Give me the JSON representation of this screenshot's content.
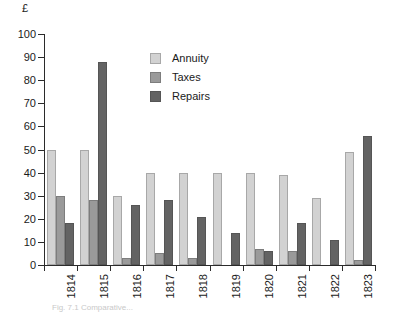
{
  "chart_data": {
    "type": "bar",
    "title": "",
    "subtitle": "",
    "xlabel": "",
    "ylabel": "£",
    "unit_label": "£",
    "categories": [
      "1814",
      "1815",
      "1816",
      "1817",
      "1818",
      "1819",
      "1820",
      "1821",
      "1822",
      "1823"
    ],
    "series": [
      {
        "name": "Annuity",
        "color": "#d2d2d2",
        "values": [
          50,
          50,
          30,
          40,
          40,
          40,
          40,
          39,
          29,
          49
        ]
      },
      {
        "name": "Taxes",
        "color": "#9a9a9a",
        "values": [
          30,
          28,
          3,
          5,
          3,
          0,
          7,
          6,
          0,
          2
        ]
      },
      {
        "name": "Repairs",
        "color": "#636363",
        "values": [
          18,
          88,
          26,
          28,
          21,
          14,
          6,
          18,
          11,
          56
        ]
      }
    ],
    "ylim": [
      0,
      100
    ],
    "ytick_step": 10,
    "yticks": [
      0,
      10,
      20,
      30,
      40,
      50,
      60,
      70,
      80,
      90,
      100
    ],
    "ytick_labels": [
      "0",
      "10",
      "20",
      "30",
      "40",
      "50",
      "60",
      "70",
      "80",
      "90",
      "100"
    ],
    "grid": false,
    "legend_position": "upper-center-right",
    "xtick_label_rotation": -90
  },
  "legend": {
    "items": [
      {
        "label": "Annuity"
      },
      {
        "label": "Taxes"
      },
      {
        "label": "Repairs"
      }
    ]
  },
  "caption": {
    "text": "Fig. 7.1 Comparative..."
  }
}
